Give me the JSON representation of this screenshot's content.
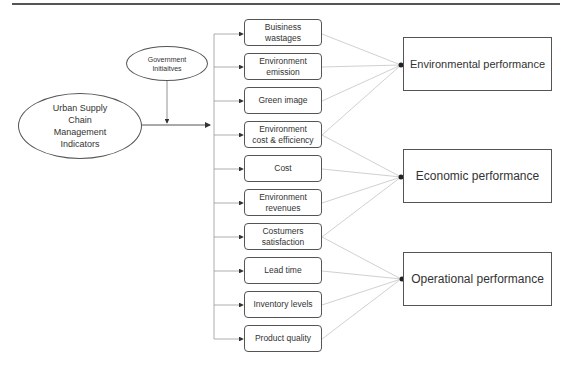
{
  "diagram": {
    "source_node": {
      "label": "Urban Supply\nChain\nManagement\nIndicators"
    },
    "moderator_node": {
      "label": "Government\nInitiaitves"
    },
    "indicators": [
      {
        "label": "Buisiness\nwastages"
      },
      {
        "label": "Environment\nemission"
      },
      {
        "label": "Green image"
      },
      {
        "label": "Environment\ncost & efficiency"
      },
      {
        "label": "Cost"
      },
      {
        "label": "Environment\nrevenues"
      },
      {
        "label": "Costumers\nsatisfaction"
      },
      {
        "label": "Lead time"
      },
      {
        "label": "Inventory levels"
      },
      {
        "label": "Product quality"
      }
    ],
    "outcomes": [
      {
        "label": "Environmental performance",
        "inputs": [
          0,
          1,
          2,
          3
        ]
      },
      {
        "label": "Economic performance",
        "inputs": [
          3,
          4,
          5,
          6
        ]
      },
      {
        "label": "Operational performance",
        "inputs": [
          6,
          7,
          8,
          9
        ]
      }
    ],
    "colors": {
      "stroke": "#555555",
      "connector": "#bbbbbb",
      "text": "#333333"
    }
  }
}
